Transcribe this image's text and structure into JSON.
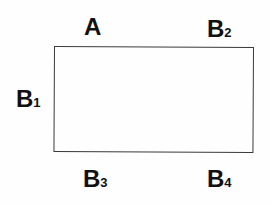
{
  "diagram": {
    "shape": "rectangle",
    "stroke_color": "#3a3a3a",
    "background": "#ffffff",
    "labels": {
      "top_left": {
        "main": "A",
        "sub": ""
      },
      "top_right": {
        "main": "B",
        "sub": "2"
      },
      "left": {
        "main": "B",
        "sub": "1"
      },
      "bottom_left": {
        "main": "B",
        "sub": "3"
      },
      "bottom_right": {
        "main": "B",
        "sub": "4"
      }
    }
  }
}
